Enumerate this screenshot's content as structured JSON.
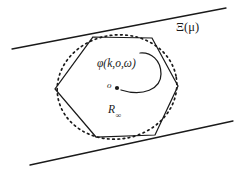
{
  "figure": {
    "background_color": "#ffffff",
    "stroke_color": "#1a1a1a",
    "width": 237,
    "height": 173
  },
  "labels": {
    "boundary_family": "Ξ(μ)",
    "potential_function": "φ(k,o,ω)",
    "origin_point": "o",
    "radius_symbol": "R",
    "radius_subscript": "∞"
  },
  "geometry": {
    "hexagon": {
      "name": "solid-hexagon",
      "stroke": "#1a1a1a",
      "stroke_width": 1.2,
      "fill": "none",
      "points": "93,37 152,38 178,86 155,135 96,137 55,89"
    },
    "dotted_circle": {
      "name": "dotted-circumcircle",
      "stroke": "#1a1a1a",
      "stroke_width": 1.6,
      "dash": "1.8 3.4",
      "cx": 117,
      "cy": 87,
      "rx": 60,
      "ry": 52,
      "rotation": -9
    },
    "tangent_line_upper": {
      "name": "upper-tangent-line",
      "x1": 12,
      "y1": 49,
      "x2": 226,
      "y2": 8
    },
    "tangent_line_lower": {
      "name": "lower-tangent-line",
      "x1": 30,
      "y1": 165,
      "x2": 233,
      "y2": 121
    },
    "center_dot": {
      "name": "origin-marker",
      "cx": 117,
      "cy": 88,
      "r": 2.0
    },
    "angle_arc": {
      "name": "angle-sweep-arc",
      "path": "M 120,90 C 142,96 160,88 160,74 C 160,60 150,52 140,53",
      "stroke_width": 1.2
    }
  }
}
